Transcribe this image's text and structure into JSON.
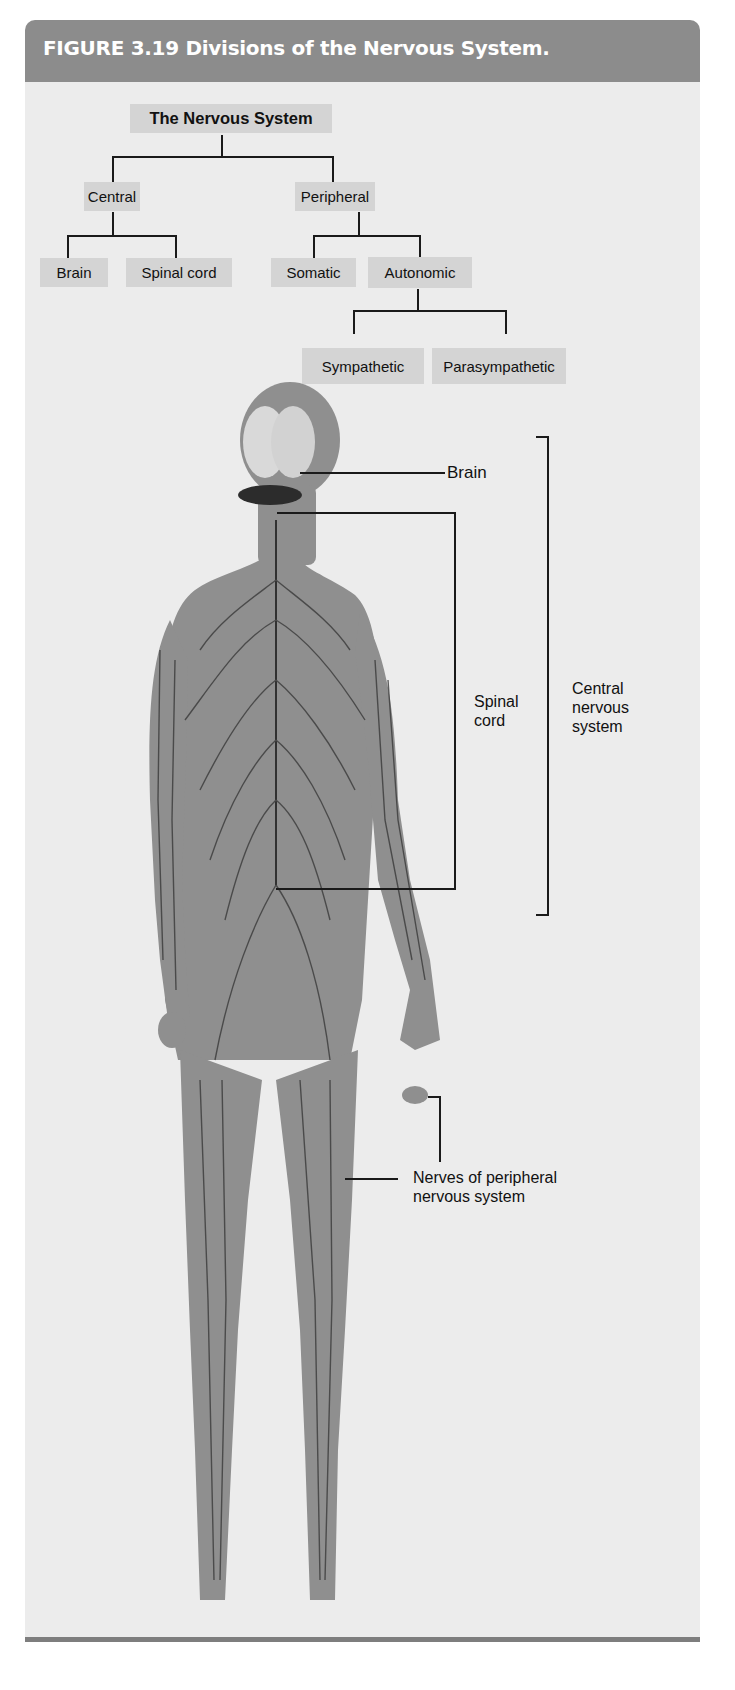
{
  "figure": {
    "title": "FIGURE 3.19  Divisions of the Nervous System.",
    "colors": {
      "header": "#8c8c8c",
      "panel": "#ececec",
      "node": "#d4d4d4",
      "body": "#8f8f8f",
      "nerves": "#3a3a3a"
    }
  },
  "tree": {
    "root": "The Nervous System",
    "central": {
      "label": "Central",
      "children": [
        "Brain",
        "Spinal cord"
      ]
    },
    "peripheral": {
      "label": "Peripheral",
      "somatic": "Somatic",
      "autonomic": {
        "label": "Autonomic",
        "children": [
          "Sympathetic",
          "Parasympathetic"
        ]
      }
    }
  },
  "illustration": {
    "labels": {
      "brain": "Brain",
      "spinal_cord": [
        "Spinal",
        "cord"
      ],
      "cns": [
        "Central",
        "nervous",
        "system"
      ],
      "pns": [
        "Nerves of peripheral",
        "nervous system"
      ]
    }
  }
}
